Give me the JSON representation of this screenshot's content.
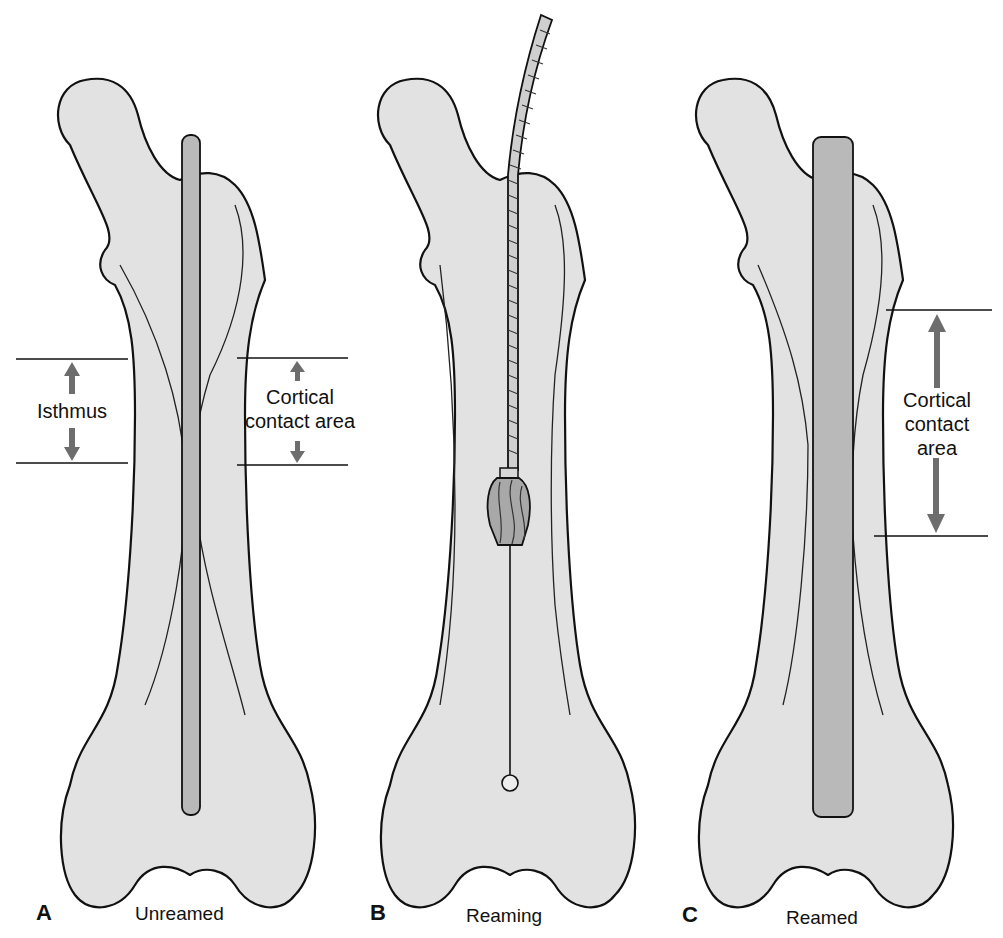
{
  "figure": {
    "panels": [
      {
        "letter": "A",
        "caption": "Unreamed",
        "annotations": {
          "left_label": "Isthmus",
          "right_label_line1": "Cortical",
          "right_label_line2": "contact area"
        }
      },
      {
        "letter": "B",
        "caption": "Reaming"
      },
      {
        "letter": "C",
        "caption": "Reamed",
        "annotations": {
          "right_label_line1": "Cortical",
          "right_label_line2": "contact",
          "right_label_line3": "area"
        }
      }
    ],
    "colors": {
      "bone_fill": "#e2e2e2",
      "nail_fill": "#b9b9b9",
      "arrow": "#6d6d6d",
      "outline": "#111111"
    }
  }
}
